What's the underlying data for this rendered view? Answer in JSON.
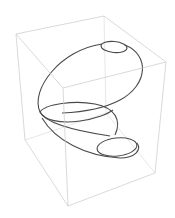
{
  "figure": {
    "type": "3d-parametric-curve",
    "colors": {
      "background": "#ffffff",
      "box": "#c8c8c8",
      "curve": "#4a4a4a"
    }
  },
  "box": {
    "vertices": {
      "top_left": [
        16,
        34
      ],
      "top_back": [
        104,
        16
      ],
      "top_right": [
        166,
        62
      ],
      "top_front": [
        63,
        88
      ],
      "bottom_left": [
        25,
        140
      ],
      "bottom_back": [
        106,
        113
      ],
      "bottom_right": [
        155,
        173
      ],
      "bottom_front": [
        68,
        206
      ]
    }
  },
  "curve": {
    "segments": [
      {
        "name": "top-small-loop",
        "cx": 114,
        "cy": 47,
        "rx": 13,
        "ry": 5.5,
        "rotate": 5
      },
      {
        "name": "large-loop",
        "cx": 91,
        "cy": 83,
        "rx": 58,
        "ry": 33,
        "rotate": -38
      },
      {
        "name": "middle-loop",
        "cx": 74,
        "cy": 113,
        "rx": 37,
        "ry": 10,
        "rotate": -4
      },
      {
        "name": "lower-loop",
        "cx": 96,
        "cy": 130,
        "rx": 42,
        "ry": 18,
        "rotate": 30
      },
      {
        "name": "bottom-small-loop",
        "cx": 118,
        "cy": 147,
        "rx": 21,
        "ry": 9,
        "rotate": -8
      }
    ]
  }
}
